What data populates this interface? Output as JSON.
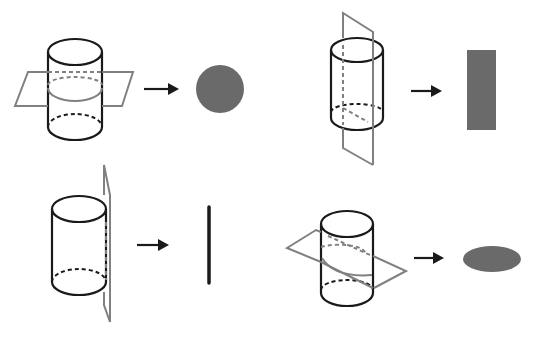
{
  "diagram": {
    "colors": {
      "outline": "#1a1a1a",
      "plane": "#808080",
      "section_fill": "#6a6a6a",
      "background": "#ffffff"
    },
    "panels": [
      {
        "id": "horizontal-cut",
        "plane": "horizontal",
        "result_shape": "circle"
      },
      {
        "id": "vertical-cut-through-axis",
        "plane": "vertical through axis",
        "result_shape": "rectangle"
      },
      {
        "id": "tangent-vertical-cut",
        "plane": "vertical tangent",
        "result_shape": "line segment"
      },
      {
        "id": "slanted-cut",
        "plane": "slanted",
        "result_shape": "ellipse"
      }
    ]
  }
}
